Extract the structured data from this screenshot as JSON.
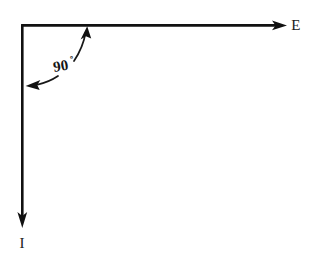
{
  "figure": {
    "name": "perpendicular-axes-right-angle-diagram",
    "background_color": "#ffffff",
    "ink_color": "#111111",
    "width": 316,
    "height": 265
  },
  "axes": {
    "horizontal": {
      "label": "E",
      "direction": "right",
      "label_x": 296,
      "label_y": 30,
      "start_x": 22,
      "start_y": 25,
      "end_x": 286,
      "end_y": 25
    },
    "vertical": {
      "label": "I",
      "direction": "down",
      "label_x": 22,
      "label_y": 248,
      "start_x": 22,
      "start_y": 25,
      "end_x": 22,
      "end_y": 227
    },
    "origin": {
      "x": 22,
      "y": 25
    }
  },
  "annotation": {
    "angle_value": "90",
    "angle_degree_symbol": "º",
    "angle_full_text": "90º",
    "label_x": 54,
    "label_y": 72,
    "arrow_up_tip": {
      "x": 88,
      "y": 27
    },
    "arrow_left_tip": {
      "x": 25,
      "y": 86
    }
  }
}
